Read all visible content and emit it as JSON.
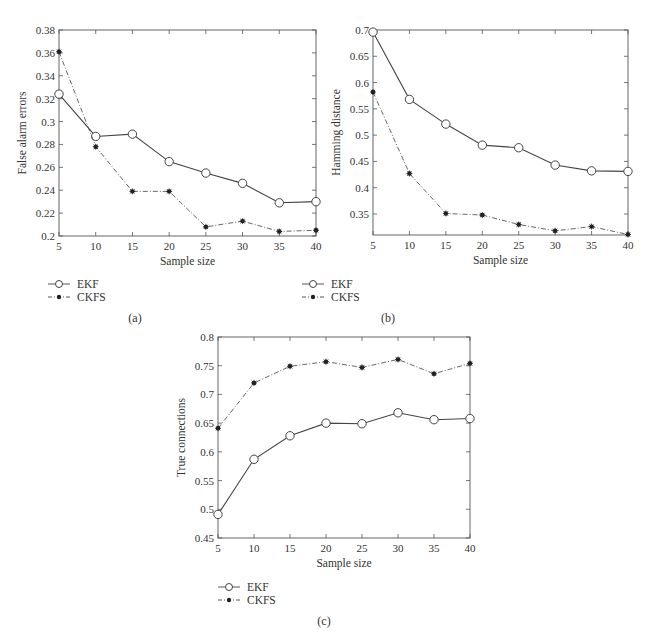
{
  "chart_data": [
    {
      "id": "a",
      "type": "line",
      "caption": "(a)",
      "title": "",
      "xlabel": "Sample size",
      "ylabel": "False alarm errors",
      "x": [
        5,
        10,
        15,
        20,
        25,
        30,
        35,
        40
      ],
      "xticks": [
        "5",
        "10",
        "15",
        "20",
        "25",
        "30",
        "35",
        "40"
      ],
      "yticks": [
        "0.2",
        "0.22",
        "0.24",
        "0.26",
        "0.28",
        "0.3",
        "0.32",
        "0.34",
        "0.36",
        "0.38"
      ],
      "ylim": [
        0.2,
        0.38
      ],
      "xlim": [
        5,
        40
      ],
      "grid": false,
      "legend_position": "below-left",
      "series": [
        {
          "name": "EKF",
          "marker": "circle",
          "line": "solid",
          "values": [
            0.324,
            0.287,
            0.289,
            0.265,
            0.255,
            0.246,
            0.229,
            0.23
          ]
        },
        {
          "name": "CKFS",
          "marker": "star",
          "line": "dash-dot",
          "values": [
            0.361,
            0.278,
            0.239,
            0.239,
            0.208,
            0.213,
            0.204,
            0.205
          ]
        }
      ]
    },
    {
      "id": "b",
      "type": "line",
      "caption": "(b)",
      "title": "",
      "xlabel": "Sample size",
      "ylabel": "Hamming distance",
      "x": [
        5,
        10,
        15,
        20,
        25,
        30,
        35,
        40
      ],
      "xticks": [
        "5",
        "10",
        "15",
        "20",
        "25",
        "30",
        "35",
        "40"
      ],
      "yticks": [
        "0.35",
        "0.4",
        "0.45",
        "0.5",
        "0.55",
        "0.6",
        "0.65",
        "0.7"
      ],
      "ylim": [
        0.31,
        0.7
      ],
      "xlim": [
        5,
        40
      ],
      "grid": false,
      "legend_position": "below-left",
      "series": [
        {
          "name": "EKF",
          "marker": "circle",
          "line": "solid",
          "values": [
            0.696,
            0.568,
            0.521,
            0.481,
            0.476,
            0.443,
            0.432,
            0.431
          ]
        },
        {
          "name": "CKFS",
          "marker": "star",
          "line": "dash-dot",
          "values": [
            0.582,
            0.427,
            0.351,
            0.348,
            0.33,
            0.318,
            0.326,
            0.311
          ]
        }
      ]
    },
    {
      "id": "c",
      "type": "line",
      "caption": "(c)",
      "title": "",
      "xlabel": "Sample size",
      "ylabel": "True connections",
      "x": [
        5,
        10,
        15,
        20,
        25,
        30,
        35,
        40
      ],
      "xticks": [
        "5",
        "10",
        "15",
        "20",
        "25",
        "30",
        "35",
        "40"
      ],
      "yticks": [
        "0.45",
        "0.5",
        "0.55",
        "0.6",
        "0.65",
        "0.7",
        "0.75",
        "0.8"
      ],
      "ylim": [
        0.45,
        0.8
      ],
      "xlim": [
        5,
        40
      ],
      "grid": false,
      "legend_position": "below-left",
      "series": [
        {
          "name": "EKF",
          "marker": "circle",
          "line": "solid",
          "values": [
            0.491,
            0.587,
            0.628,
            0.65,
            0.649,
            0.668,
            0.656,
            0.658
          ]
        },
        {
          "name": "CKFS",
          "marker": "star",
          "line": "dash-dot",
          "values": [
            0.641,
            0.72,
            0.749,
            0.757,
            0.747,
            0.761,
            0.736,
            0.754
          ]
        }
      ]
    }
  ],
  "layout": [
    {
      "left": 59,
      "top": 30,
      "right": 316,
      "bottom": 236,
      "legendX": 48,
      "legendY": 284,
      "captionX": 135,
      "captionY": 322
    },
    {
      "left": 373,
      "top": 30,
      "right": 628,
      "bottom": 235,
      "legendX": 302,
      "legendY": 284,
      "captionX": 388,
      "captionY": 322
    },
    {
      "left": 218,
      "top": 337,
      "right": 470,
      "bottom": 538,
      "legendX": 218,
      "legendY": 587,
      "captionX": 324,
      "captionY": 625
    }
  ]
}
